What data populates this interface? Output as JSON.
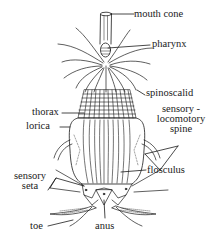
{
  "diagram": {
    "labels": {
      "mouth_cone": "mouth cone",
      "pharynx": "pharynx",
      "spinoscalid": "spinoscalid",
      "sensory_locomotory_spine_1": "sensory -",
      "sensory_locomotory_spine_2": "locomotory",
      "sensory_locomotory_spine_3": "spine",
      "thorax": "thorax",
      "lorica": "lorica",
      "sensory_seta_1": "sensory",
      "sensory_seta_2": "seta",
      "flosculus": "flosculus",
      "toe": "toe",
      "anus": "anus"
    },
    "colors": {
      "ink": "#1a1a1a",
      "background": "#ffffff"
    }
  }
}
